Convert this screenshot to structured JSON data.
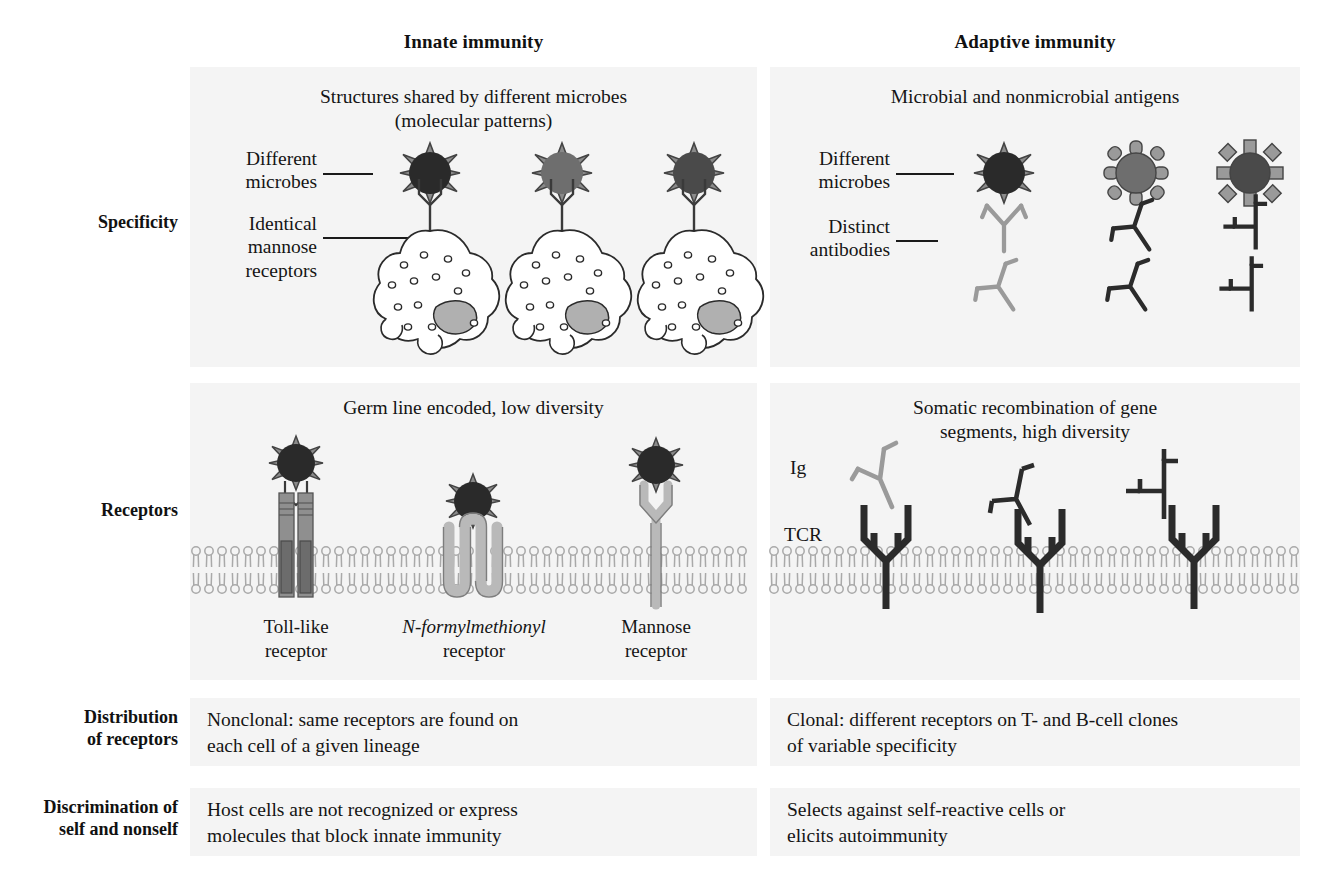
{
  "figure": {
    "columns": [
      {
        "id": "innate",
        "title": "Innate immunity"
      },
      {
        "id": "adaptive",
        "title": "Adaptive immunity"
      }
    ],
    "row_labels": [
      {
        "id": "specificity",
        "line1": "Specificity",
        "line2": ""
      },
      {
        "id": "receptors",
        "line1": "Receptors",
        "line2": ""
      },
      {
        "id": "distribution",
        "line1": "Distribution",
        "line2": "of receptors"
      },
      {
        "id": "discrimination",
        "line1": "Discrimination of",
        "line2": "self and nonself"
      }
    ],
    "rows": {
      "specificity": {
        "innate": {
          "title_line1": "Structures shared by different microbes",
          "title_line2": "(molecular patterns)",
          "callout_microbes_line1": "Different",
          "callout_microbes_line2": "microbes",
          "callout_receptors_line1": "Identical",
          "callout_receptors_line2": "mannose",
          "callout_receptors_line3": "receptors"
        },
        "adaptive": {
          "title_line1": "Microbial and nonmicrobial antigens",
          "callout_microbes_line1": "Different",
          "callout_microbes_line2": "microbes",
          "callout_antibodies_line1": "Distinct",
          "callout_antibodies_line2": "antibodies"
        }
      },
      "receptors": {
        "innate": {
          "title_line1": "Germ line encoded, low diversity",
          "captions": [
            {
              "line1": "Toll-like",
              "line2": "receptor",
              "italic_prefix": ""
            },
            {
              "line1": "N-formylmethionyl",
              "line2": "receptor",
              "italic_prefix": "N"
            },
            {
              "line1": "Mannose",
              "line2": "receptor",
              "italic_prefix": ""
            }
          ]
        },
        "adaptive": {
          "title_line1": "Somatic recombination of gene",
          "title_line2": "segments, high diversity",
          "label_ig": "Ig",
          "label_tcr": "TCR"
        }
      },
      "distribution": {
        "innate_line1": "Nonclonal: same receptors are found on",
        "innate_line2": "each cell of a given lineage",
        "adaptive_line1": "Clonal: different receptors on T- and B-cell clones",
        "adaptive_line2": "of variable specificity"
      },
      "discrimination": {
        "innate_line1": "Host cells are not recognized or express",
        "innate_line2": "molecules that block innate immunity",
        "adaptive_line1": "Selects against self-reactive cells or",
        "adaptive_line2": "elicits autoimmunity"
      }
    },
    "colors": {
      "panel_background": "#f4f4f4",
      "page_background": "#ffffff",
      "text": "#151515",
      "microbe_dark": "#2a2a2a",
      "microbe_mid": "#6e6e6e",
      "microbe_spike": "#8a8a8a",
      "receptor_gray": "#8f8f8f",
      "receptor_light": "#b9b9b9",
      "antibody_dark": "#2b2b2b",
      "antibody_gray": "#9a9a9a",
      "membrane_gray": "#a9a9a9",
      "nucleus_gray": "#b0b0b0"
    }
  }
}
